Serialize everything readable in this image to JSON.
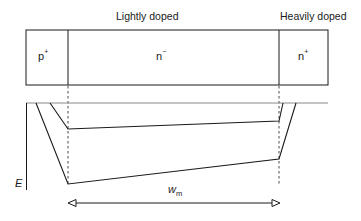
{
  "diagram": {
    "labels": {
      "lightly_doped": "Lightly doped",
      "heavily_doped": "Heavily doped"
    },
    "regions": [
      {
        "base": "p",
        "sup": "+"
      },
      {
        "base": "n",
        "sup": "−"
      },
      {
        "base": "n",
        "sup": "+"
      }
    ],
    "axis": {
      "y_label": "E"
    },
    "width_marker": {
      "base": "w",
      "sub": "m"
    },
    "colors": {
      "line": "#1a1a1a",
      "axis_line": "#8a8a8a"
    }
  }
}
